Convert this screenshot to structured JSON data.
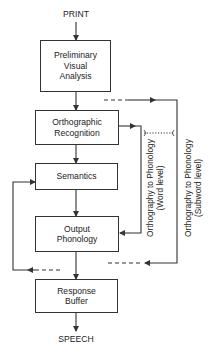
{
  "diagram": {
    "input_label": "PRINT",
    "output_label": "SPEECH",
    "boxes": [
      {
        "id": "preliminary-visual-analysis",
        "lines": [
          "Preliminary",
          "Visual",
          "Analysis"
        ]
      },
      {
        "id": "orthographic-recognition",
        "lines": [
          "Orthographic",
          "Recognition"
        ]
      },
      {
        "id": "semantics",
        "lines": [
          "Semantics"
        ]
      },
      {
        "id": "output-phonology",
        "lines": [
          "Output",
          "Phonology"
        ]
      },
      {
        "id": "response-buffer",
        "lines": [
          "Response",
          "Buffer"
        ]
      }
    ],
    "routes": [
      {
        "id": "word-level",
        "lines": [
          "Orthography to Phonology",
          "(Word level)"
        ]
      },
      {
        "id": "subword-level",
        "lines": [
          "Orthography to Phonology",
          "(Subword level)"
        ]
      }
    ],
    "colors": {
      "line": "#333333",
      "background": "#ffffff"
    }
  }
}
